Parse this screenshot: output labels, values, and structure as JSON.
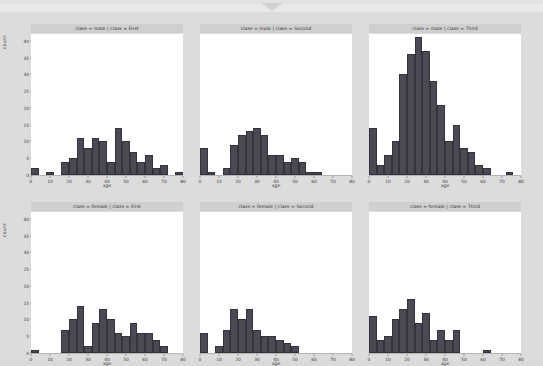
{
  "topbar": {
    "notch_icon": "chevron-down-notch"
  },
  "figure": {
    "ylabel": "count",
    "xlabel": "age",
    "yticks": [
      "0",
      "5",
      "10",
      "15",
      "20",
      "25",
      "30",
      "35",
      "40"
    ],
    "xticks": [
      "0",
      "10",
      "20",
      "30",
      "40",
      "50",
      "60",
      "70",
      "80"
    ],
    "bar_color": "#4a4a54",
    "panel_bg": "#ffffff",
    "strip_bg": "#cfcfcf",
    "figure_bg": "#dcdcdc"
  },
  "chart_data": {
    "type": "bar",
    "title": "",
    "xlabel": "age",
    "ylabel": "count",
    "xlim": [
      0,
      80
    ],
    "ylim": [
      0,
      42
    ],
    "grid": false,
    "legend": "none",
    "facet_rows": [
      "male",
      "female"
    ],
    "facet_cols": [
      "First",
      "Second",
      "Third"
    ],
    "bin_width": 4,
    "bin_centers": [
      2,
      6,
      10,
      14,
      18,
      22,
      26,
      30,
      34,
      38,
      42,
      46,
      50,
      54,
      58,
      62,
      66,
      70,
      74,
      78
    ],
    "panels": [
      {
        "title": "class = male | class = First",
        "row": "male",
        "col": "First",
        "categories": [
          "0-4",
          "4-8",
          "8-12",
          "12-16",
          "16-20",
          "20-24",
          "24-28",
          "28-32",
          "32-36",
          "36-40",
          "40-44",
          "44-48",
          "48-52",
          "52-56",
          "56-60",
          "60-64",
          "64-68",
          "68-72",
          "72-76",
          "76-80"
        ],
        "values": [
          2,
          0,
          1,
          0,
          4,
          5,
          11,
          8,
          11,
          10,
          4,
          14,
          10,
          7,
          4,
          6,
          2,
          3,
          0,
          1
        ]
      },
      {
        "title": "class = male | class = Second",
        "row": "male",
        "col": "Second",
        "categories": [
          "0-4",
          "4-8",
          "8-12",
          "12-16",
          "16-20",
          "20-24",
          "24-28",
          "28-32",
          "32-36",
          "36-40",
          "40-44",
          "44-48",
          "48-52",
          "52-56",
          "56-60",
          "60-64",
          "64-68",
          "68-72",
          "72-76",
          "76-80"
        ],
        "values": [
          8,
          1,
          0,
          2,
          9,
          12,
          13,
          14,
          12,
          6,
          6,
          4,
          5,
          4,
          1,
          1,
          0,
          0,
          0,
          0
        ]
      },
      {
        "title": "class = male | class = Third",
        "row": "male",
        "col": "Third",
        "categories": [
          "0-4",
          "4-8",
          "8-12",
          "12-16",
          "16-20",
          "20-24",
          "24-28",
          "28-32",
          "32-36",
          "36-40",
          "40-44",
          "44-48",
          "48-52",
          "52-56",
          "56-60",
          "60-64",
          "64-68",
          "68-72",
          "72-76",
          "76-80"
        ],
        "values": [
          14,
          3,
          6,
          10,
          30,
          36,
          41,
          37,
          28,
          21,
          10,
          15,
          8,
          7,
          3,
          2,
          0,
          0,
          1,
          0
        ]
      },
      {
        "title": "class = female | class = First",
        "row": "female",
        "col": "First",
        "categories": [
          "0-4",
          "4-8",
          "8-12",
          "12-16",
          "16-20",
          "20-24",
          "24-28",
          "28-32",
          "32-36",
          "36-40",
          "40-44",
          "44-48",
          "48-52",
          "52-56",
          "56-60",
          "60-64",
          "64-68",
          "68-72",
          "72-76",
          "76-80"
        ],
        "values": [
          1,
          0,
          0,
          0,
          7,
          10,
          14,
          2,
          9,
          13,
          10,
          6,
          5,
          9,
          6,
          6,
          4,
          2,
          0,
          0
        ]
      },
      {
        "title": "class = female | class = Second",
        "row": "female",
        "col": "Second",
        "categories": [
          "0-4",
          "4-8",
          "8-12",
          "12-16",
          "16-20",
          "20-24",
          "24-28",
          "28-32",
          "32-36",
          "36-40",
          "40-44",
          "44-48",
          "48-52",
          "52-56",
          "56-60",
          "60-64",
          "64-68",
          "68-72",
          "72-76",
          "76-80"
        ],
        "values": [
          6,
          0,
          2,
          7,
          13,
          10,
          13,
          7,
          5,
          5,
          4,
          3,
          2,
          0,
          0,
          0,
          0,
          0,
          0,
          0
        ]
      },
      {
        "title": "class = female | class = Third",
        "row": "female",
        "col": "Third",
        "categories": [
          "0-4",
          "4-8",
          "8-12",
          "12-16",
          "16-20",
          "20-24",
          "24-28",
          "28-32",
          "32-36",
          "36-40",
          "40-44",
          "44-48",
          "48-52",
          "52-56",
          "56-60",
          "60-64",
          "64-68",
          "68-72",
          "72-76",
          "76-80"
        ],
        "values": [
          11,
          4,
          5,
          10,
          13,
          16,
          9,
          12,
          4,
          7,
          4,
          7,
          0,
          0,
          0,
          1,
          0,
          0,
          0,
          0
        ]
      }
    ]
  }
}
